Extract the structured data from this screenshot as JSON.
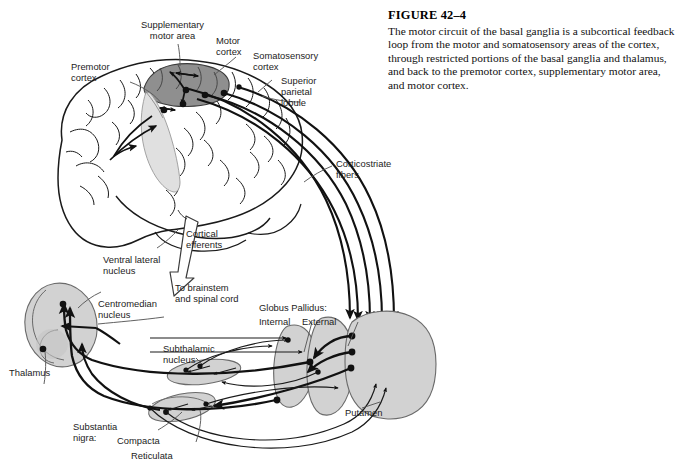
{
  "figure": {
    "number_label": "FIGURE  42–4",
    "caption": "The motor circuit of the basal ganglia is a subcortical feedback loop from the motor and somatosensory areas of the cortex, through restricted portions of the basal ganglia and thalamus, and back to the premotor cortex, supplementary motor area, and motor cortex."
  },
  "labels": {
    "supplementary_motor_area": "Supplementary\nmotor area",
    "motor_cortex": "Motor\ncortex",
    "somatosensory_cortex": "Somatosensory\ncortex",
    "superior_parietal_lobule": "Superior\nparietal\nlobule",
    "premotor_cortex": "Premotor\ncortex",
    "corticostriate_fibers": "Corticostriate\nfibers",
    "cortical_efferents": "Cortical\nefferents",
    "to_brainstem": "To brainstem\nand spinal cord",
    "ventral_lateral_nucleus": "Ventral lateral\nnucleus",
    "centromedian_nucleus": "Centromedian\nnucleus",
    "thalamus": "Thalamus",
    "globus_pallidus": "Globus Pallidus:",
    "gp_internal": "Internal",
    "gp_external": "External",
    "subthalamic_nucleus": "Subthalamic\nnucleus",
    "substantia_nigra": "Substantia\nnigra:",
    "sn_compacta": "Compacta",
    "sn_reticulata": "Reticulata",
    "putamen": "Putamen"
  },
  "colors": {
    "page_background": "#ffffff",
    "ink": "#1a1a1a",
    "structure_fill": "#d2d2d2",
    "structure_stroke": "#5a5a5a",
    "sma_dark_fill": "#8f8f8f",
    "sma_light_fill": "#e0e0e0",
    "brain_fill": "#ffffff",
    "brain_stroke": "#1a1a1a",
    "leader_stroke": "#4a4a4a",
    "pathway_stroke": "#111111"
  },
  "diagram": {
    "title": "Motor circuit of the basal ganglia",
    "structures": [
      "Thalamus",
      "Globus Pallidus Internal",
      "Globus Pallidus External",
      "Putamen",
      "Subthalamic nucleus",
      "Substantia nigra"
    ],
    "pathway_count_corticostriate": 5
  }
}
